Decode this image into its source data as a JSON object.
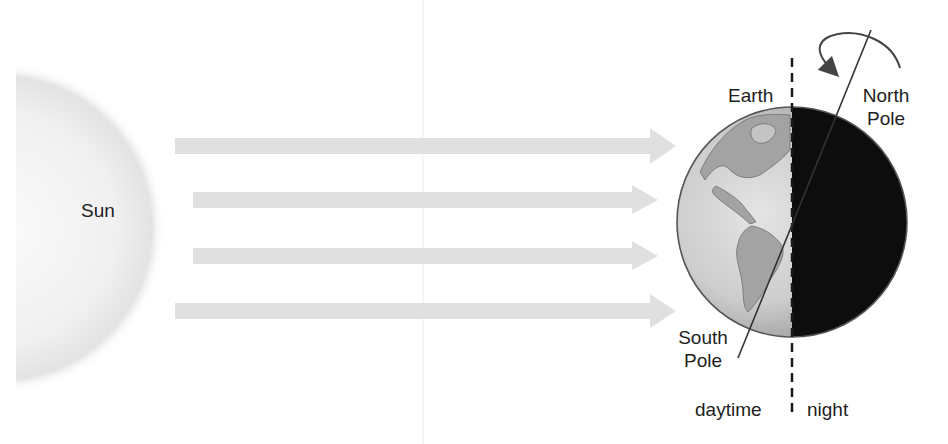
{
  "diagram": {
    "sun": {
      "label": "Sun",
      "color": "#f2f2f2",
      "edge_color": "#d6d6d6"
    },
    "earth": {
      "label": "Earth",
      "day_color": "#c8c8c8",
      "land_color": "#9c9c9c",
      "night_color": "#0d0d0d",
      "outline_color": "#555555"
    },
    "poles": {
      "north": [
        "North",
        "Pole"
      ],
      "south": [
        "South",
        "Pole"
      ]
    },
    "terminator": {
      "day_label": "daytime",
      "night_label": "night"
    },
    "rays": {
      "count": 4,
      "color": "#e0e0e0"
    },
    "rotation_arrow": {
      "direction": "counter-clockwise (viewed from above North Pole)"
    }
  }
}
